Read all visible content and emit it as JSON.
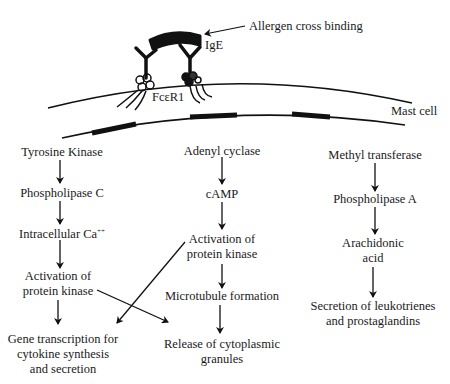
{
  "top_labels": {
    "allergen": "Allergen cross binding",
    "ige": "IgE",
    "receptor": "FcεR1",
    "cell": "Mast cell"
  },
  "pathways": {
    "left": {
      "n1": "Tyrosine Kinase",
      "n2": "Phospholipase C",
      "n3": "Intracellular Ca",
      "n3_sup": "++",
      "n4a": "Activation of",
      "n4b": "protein kinase"
    },
    "middle": {
      "n1": "Adenyl cyclase",
      "n2": "cAMP",
      "n3a": "Activation of",
      "n3b": "protein kinase",
      "n4": "Microtubule formation"
    },
    "right": {
      "n1": "Methyl transferase",
      "n2": "Phospholipase A",
      "n3a": "Arachidonic",
      "n3b": "acid",
      "n4a": "Secretion of leukotrienes",
      "n4b": "and prostaglandins"
    }
  },
  "outcomes": {
    "gene_a": "Gene transcription for",
    "gene_b": "cytokine synthesis",
    "gene_c": "and secretion",
    "release_a": "Release of cytoplasmic",
    "release_b": "granules"
  }
}
